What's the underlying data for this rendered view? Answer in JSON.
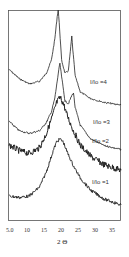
{
  "chart_data": {
    "type": "line",
    "title": "",
    "xlabel": "2 Θ",
    "ylabel": "",
    "xlim": [
      5.0,
      38
    ],
    "x_ticks": [
      "5.0",
      "10",
      "15",
      "20",
      "25",
      "30",
      "35"
    ],
    "x_tick_values": [
      5,
      10,
      15,
      20,
      25,
      30,
      35
    ],
    "grid": false,
    "legend_position": "inline-right",
    "y_axis": "intensity (arbitrary, curves vertically offset)",
    "series": [
      {
        "name": "I/Io =4",
        "label": "I/Io =4",
        "peaks": [
          {
            "x": 19.5,
            "height": "very sharp, tallest"
          },
          {
            "x": 23.5,
            "height": "sharp, secondary"
          }
        ],
        "x": [
          5,
          8,
          11,
          14,
          16,
          17.5,
          18.5,
          19.2,
          19.5,
          19.8,
          20.5,
          21.5,
          22.5,
          23.2,
          23.5,
          23.8,
          24.5,
          26,
          29,
          33,
          38
        ],
        "y": [
          0.55,
          0.48,
          0.44,
          0.46,
          0.52,
          0.62,
          0.78,
          0.95,
          1.0,
          0.9,
          0.62,
          0.52,
          0.54,
          0.72,
          0.8,
          0.7,
          0.5,
          0.38,
          0.33,
          0.3,
          0.28
        ]
      },
      {
        "name": "I/Io =3",
        "label": "I/Io =3",
        "peaks": [
          {
            "x": 20.0,
            "height": "sharp"
          },
          {
            "x": 24.0,
            "height": "smaller"
          }
        ],
        "x": [
          5,
          8,
          11,
          14,
          16,
          17.5,
          18.5,
          19.5,
          20,
          20.5,
          21.5,
          22.5,
          23.5,
          24,
          24.5,
          26,
          29,
          33,
          38
        ],
        "y": [
          0.45,
          0.38,
          0.36,
          0.38,
          0.44,
          0.52,
          0.62,
          0.8,
          0.88,
          0.78,
          0.6,
          0.58,
          0.64,
          0.66,
          0.55,
          0.42,
          0.32,
          0.27,
          0.24
        ]
      },
      {
        "name": "I/Io =2",
        "label": "I/Io =2",
        "peaks": [
          {
            "x": 20.0,
            "height": "broad, noisy"
          }
        ],
        "x": [
          5,
          8,
          11,
          14,
          16,
          18,
          19,
          20,
          21,
          22,
          24,
          26,
          29,
          33,
          38
        ],
        "y": [
          0.5,
          0.46,
          0.44,
          0.48,
          0.58,
          0.72,
          0.8,
          0.84,
          0.8,
          0.72,
          0.6,
          0.5,
          0.42,
          0.36,
          0.32
        ]
      },
      {
        "name": "I/Io =1",
        "label": "I/Io =1",
        "peaks": [
          {
            "x": 20.0,
            "height": "broad amorphous halo"
          }
        ],
        "x": [
          5,
          8,
          11,
          14,
          16,
          18,
          19,
          20,
          21,
          22,
          24,
          26,
          29,
          33,
          38
        ],
        "y": [
          0.2,
          0.19,
          0.2,
          0.26,
          0.36,
          0.5,
          0.56,
          0.58,
          0.56,
          0.5,
          0.4,
          0.32,
          0.24,
          0.18,
          0.14
        ]
      }
    ],
    "annotations": [
      "I/Io =4",
      "I/Io =3",
      "I/Io =2",
      "I/Io =1"
    ]
  },
  "axis": {
    "ticks": [
      "5.0",
      "10",
      "15",
      "20",
      "25",
      "30",
      "35"
    ],
    "xlabel": "2 Θ"
  },
  "labels": {
    "s4": "I/Io =4",
    "s3": "I/Io =3",
    "s2": "I/Io =2",
    "s1": "I/Io =1"
  },
  "colors": {
    "line": "#222222",
    "frame": "#555555",
    "text": "#333333"
  }
}
